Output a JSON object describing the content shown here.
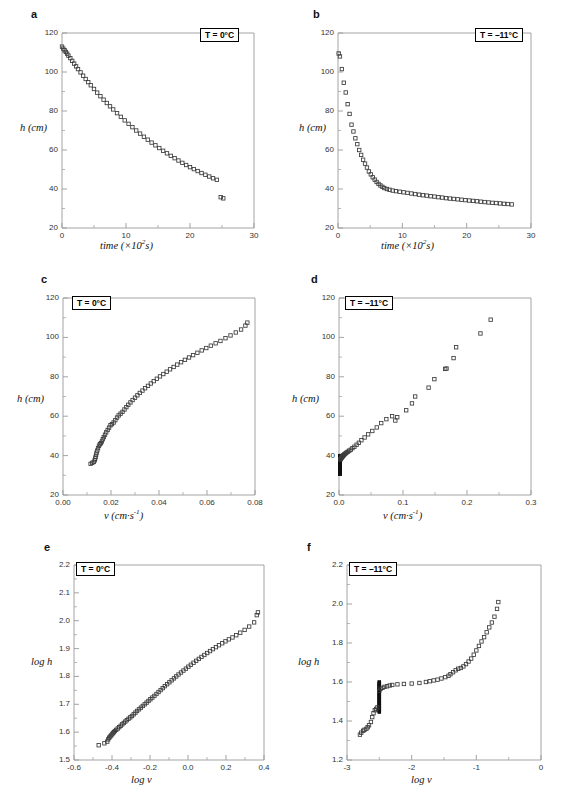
{
  "figure": {
    "width": 563,
    "height": 801,
    "background": "#ffffff",
    "marker_color": "#3a3a3a",
    "axis_color": "#9a9a9a",
    "dense_color": "#111111"
  },
  "panels": [
    {
      "letter": "a",
      "temperature_label": "T = 0°C",
      "xlabel_html": "time (×10<sup>2</sup>s)",
      "ylabel": "h (cm)",
      "xticks": [
        "0",
        "10",
        "20",
        "30"
      ],
      "yticks": [
        "20",
        "40",
        "60",
        "80",
        "100",
        "120"
      ]
    },
    {
      "letter": "b",
      "temperature_label": "T = –11°C",
      "xlabel_html": "time (×10<sup>2</sup>s)",
      "ylabel": "h (cm)",
      "xticks": [
        "0",
        "10",
        "20",
        "30"
      ],
      "yticks": [
        "20",
        "40",
        "60",
        "80",
        "100",
        "120"
      ]
    },
    {
      "letter": "c",
      "temperature_label": "T = 0°C",
      "xlabel_html": "v (cm·s<sup>-1</sup>)",
      "ylabel": "h (cm)",
      "xticks": [
        "0.00",
        "0.02",
        "0.04",
        "0.06",
        "0.08"
      ],
      "yticks": [
        "20",
        "40",
        "60",
        "80",
        "100",
        "120"
      ]
    },
    {
      "letter": "d",
      "temperature_label": "T = –11°C",
      "xlabel_html": "v (cm·s<sup>-1</sup>)",
      "ylabel": "h (cm)",
      "xticks": [
        "0.0",
        "0.1",
        "0.2",
        "0.3"
      ],
      "yticks": [
        "20",
        "40",
        "60",
        "80",
        "100",
        "120"
      ]
    },
    {
      "letter": "e",
      "temperature_label": "T = 0°C",
      "xlabel_html": "log v",
      "ylabel": "log h",
      "xticks": [
        "-0.6",
        "-0.4",
        "-0.2",
        "0.0",
        "0.2",
        "0.4"
      ],
      "yticks": [
        "1.5",
        "1.6",
        "1.7",
        "1.8",
        "1.9",
        "2.0",
        "2.1",
        "2.2"
      ]
    },
    {
      "letter": "f",
      "temperature_label": "T = –11°C",
      "xlabel_html": "log v",
      "ylabel": "log h",
      "xticks": [
        "-3",
        "-2",
        "-1",
        "0"
      ],
      "yticks": [
        "1.2",
        "1.4",
        "1.6",
        "1.8",
        "2.0",
        "2.2"
      ]
    }
  ],
  "chart_data": [
    {
      "panel": "a",
      "type": "scatter",
      "title": "",
      "xlabel": "time (×10^2 s)",
      "ylabel": "h (cm)",
      "xlim": [
        0,
        30
      ],
      "ylim": [
        20,
        120
      ],
      "xticks": [
        0,
        10,
        20,
        30
      ],
      "yticks": [
        20,
        40,
        60,
        80,
        100,
        120
      ],
      "grid": false,
      "legend": "T = 0°C",
      "marker": "open-square",
      "x": [
        0.0,
        0.2,
        0.4,
        0.6,
        0.8,
        1.0,
        1.3,
        1.6,
        1.9,
        2.2,
        2.5,
        2.9,
        3.3,
        3.7,
        4.1,
        4.5,
        5.0,
        5.5,
        6.0,
        6.5,
        7.0,
        7.5,
        8.0,
        8.6,
        9.2,
        9.8,
        10.4,
        11.0,
        11.6,
        12.2,
        12.8,
        13.4,
        14.0,
        14.6,
        15.2,
        15.8,
        16.4,
        17.0,
        17.6,
        18.2,
        18.8,
        19.4,
        20.0,
        20.6,
        21.2,
        21.8,
        22.4,
        23.0,
        23.6,
        24.2,
        24.8,
        25.2
      ],
      "y": [
        113.0,
        112.0,
        111.2,
        110.3,
        109.4,
        108.4,
        107.1,
        105.7,
        104.3,
        102.9,
        101.5,
        99.8,
        98.1,
        96.4,
        94.8,
        93.2,
        91.3,
        89.4,
        87.6,
        85.8,
        84.1,
        82.4,
        80.8,
        78.9,
        77.0,
        75.2,
        73.4,
        71.7,
        70.0,
        68.4,
        66.8,
        65.3,
        63.8,
        62.4,
        61.0,
        59.6,
        58.3,
        57.0,
        55.8,
        54.6,
        53.4,
        52.3,
        51.2,
        50.2,
        49.2,
        48.2,
        47.3,
        46.4,
        45.5,
        44.7,
        35.8,
        35.2
      ]
    },
    {
      "panel": "b",
      "type": "scatter",
      "title": "",
      "xlabel": "time (×10^2 s)",
      "ylabel": "h (cm)",
      "xlim": [
        0,
        30
      ],
      "ylim": [
        20,
        120
      ],
      "xticks": [
        0,
        10,
        20,
        30
      ],
      "yticks": [
        20,
        40,
        60,
        80,
        100,
        120
      ],
      "grid": false,
      "legend": "T = –11°C",
      "marker": "open-square",
      "x": [
        0.1,
        0.3,
        0.6,
        0.9,
        1.2,
        1.5,
        1.8,
        2.1,
        2.4,
        2.7,
        3.0,
        3.3,
        3.6,
        3.9,
        4.2,
        4.5,
        4.8,
        5.1,
        5.4,
        5.7,
        6.0,
        6.3,
        6.6,
        6.9,
        7.2,
        7.6,
        8.0,
        8.5,
        9.0,
        9.6,
        10.2,
        10.8,
        11.4,
        12.0,
        12.6,
        13.2,
        13.8,
        14.4,
        15.0,
        15.6,
        16.2,
        16.8,
        17.4,
        18.0,
        18.6,
        19.2,
        19.8,
        20.4,
        21.0,
        21.6,
        22.2,
        22.8,
        23.4,
        24.0,
        24.6,
        25.2,
        25.8,
        26.4,
        27.0
      ],
      "y": [
        109.5,
        108.0,
        101.5,
        94.5,
        89.5,
        83.5,
        78.5,
        73.0,
        69.5,
        66.0,
        63.0,
        60.0,
        57.5,
        55.0,
        53.0,
        51.0,
        49.0,
        47.5,
        46.0,
        44.8,
        43.6,
        42.6,
        41.8,
        41.1,
        40.5,
        40.0,
        39.6,
        39.2,
        38.9,
        38.6,
        38.3,
        38.0,
        37.7,
        37.4,
        37.1,
        36.8,
        36.6,
        36.3,
        36.1,
        35.8,
        35.6,
        35.3,
        35.1,
        34.9,
        34.7,
        34.5,
        34.3,
        34.1,
        33.9,
        33.7,
        33.5,
        33.3,
        33.1,
        32.9,
        32.8,
        32.6,
        32.4,
        32.3,
        32.1
      ]
    },
    {
      "panel": "c",
      "type": "scatter",
      "title": "",
      "xlabel": "v (cm·s^-1)",
      "ylabel": "h (cm)",
      "xlim": [
        0.0,
        0.08
      ],
      "ylim": [
        20,
        120
      ],
      "xticks": [
        0.0,
        0.02,
        0.04,
        0.06,
        0.08
      ],
      "yticks": [
        20,
        40,
        60,
        80,
        100,
        120
      ],
      "grid": false,
      "legend": "T = 0°C",
      "marker": "open-square",
      "x": [
        0.0115,
        0.0122,
        0.0128,
        0.0132,
        0.0134,
        0.0136,
        0.0138,
        0.014,
        0.0143,
        0.0146,
        0.015,
        0.0154,
        0.0158,
        0.0162,
        0.0166,
        0.017,
        0.0175,
        0.018,
        0.0186,
        0.0192,
        0.0198,
        0.0204,
        0.0211,
        0.0218,
        0.0225,
        0.0232,
        0.024,
        0.0248,
        0.0256,
        0.0264,
        0.0272,
        0.0281,
        0.029,
        0.03,
        0.031,
        0.032,
        0.0331,
        0.0342,
        0.0354,
        0.0366,
        0.0378,
        0.0391,
        0.0404,
        0.0418,
        0.0432,
        0.0446,
        0.0461,
        0.0476,
        0.0492,
        0.0508,
        0.0525,
        0.0542,
        0.056,
        0.0578,
        0.0597,
        0.0616,
        0.0636,
        0.0656,
        0.0677,
        0.0698,
        0.072,
        0.0742,
        0.076,
        0.0768
      ],
      "y": [
        35.8,
        36.3,
        36.8,
        37.6,
        38.5,
        39.4,
        40.5,
        41.5,
        42.6,
        43.8,
        45.0,
        45.8,
        46.3,
        47.2,
        48.3,
        49.4,
        50.6,
        51.8,
        53.0,
        54.2,
        55.4,
        56.0,
        56.8,
        58.0,
        59.3,
        60.4,
        61.3,
        62.2,
        63.4,
        64.6,
        65.8,
        67.0,
        68.2,
        69.4,
        70.6,
        71.8,
        73.0,
        74.2,
        75.4,
        76.6,
        77.8,
        79.0,
        80.2,
        81.4,
        82.6,
        83.8,
        85.0,
        86.2,
        87.4,
        88.6,
        89.8,
        91.0,
        92.2,
        93.4,
        94.6,
        95.8,
        97.0,
        98.2,
        99.6,
        101.0,
        102.5,
        104.0,
        106.0,
        107.5
      ]
    },
    {
      "panel": "d",
      "type": "scatter",
      "title": "",
      "xlabel": "v (cm·s^-1)",
      "ylabel": "h (cm)",
      "xlim": [
        0.0,
        0.3
      ],
      "ylim": [
        20,
        120
      ],
      "xticks": [
        0.0,
        0.1,
        0.2,
        0.3
      ],
      "yticks": [
        20,
        40,
        60,
        80,
        100,
        120
      ],
      "grid": false,
      "legend": "T = –11°C",
      "marker": "open-square",
      "note": "dense vertical cluster of low-velocity points near v=0 spanning h=30-40",
      "x": [
        0.002,
        0.0025,
        0.003,
        0.0035,
        0.004,
        0.0045,
        0.005,
        0.0055,
        0.006,
        0.0065,
        0.007,
        0.008,
        0.009,
        0.0105,
        0.012,
        0.014,
        0.016,
        0.0185,
        0.021,
        0.024,
        0.0275,
        0.031,
        0.035,
        0.04,
        0.0455,
        0.052,
        0.059,
        0.066,
        0.074,
        0.083,
        0.088,
        0.091,
        0.105,
        0.114,
        0.119,
        0.14,
        0.149,
        0.166,
        0.168,
        0.179,
        0.183,
        0.221,
        0.237
      ],
      "y": [
        38.0,
        38.3,
        38.6,
        38.8,
        39.0,
        39.2,
        39.4,
        39.6,
        39.8,
        40.0,
        40.2,
        40.5,
        40.8,
        41.2,
        41.6,
        42.0,
        42.5,
        43.0,
        43.8,
        44.5,
        45.5,
        46.5,
        47.8,
        49.2,
        50.8,
        52.5,
        54.3,
        56.5,
        58.5,
        60.0,
        57.8,
        59.5,
        63.0,
        66.5,
        70.0,
        74.5,
        78.8,
        84.0,
        84.2,
        89.5,
        95.0,
        102.0,
        109.0
      ],
      "dense_cluster": {
        "x": 0.0015,
        "y_min": 30.5,
        "y_max": 40.0,
        "count": 60
      }
    },
    {
      "panel": "e",
      "type": "scatter",
      "title": "",
      "xlabel": "log v",
      "ylabel": "log h",
      "xlim": [
        -0.6,
        0.4
      ],
      "ylim": [
        1.5,
        2.2
      ],
      "xticks": [
        -0.6,
        -0.4,
        -0.2,
        0.0,
        0.2,
        0.4
      ],
      "yticks": [
        1.5,
        1.6,
        1.7,
        1.8,
        1.9,
        2.0,
        2.1,
        2.2
      ],
      "grid": false,
      "legend": "T = 0°C",
      "marker": "open-square",
      "slope_estimate": 0.57,
      "x": [
        -0.47,
        -0.44,
        -0.425,
        -0.42,
        -0.415,
        -0.41,
        -0.405,
        -0.4,
        -0.395,
        -0.39,
        -0.385,
        -0.378,
        -0.37,
        -0.362,
        -0.354,
        -0.346,
        -0.338,
        -0.33,
        -0.322,
        -0.313,
        -0.304,
        -0.295,
        -0.286,
        -0.277,
        -0.268,
        -0.258,
        -0.248,
        -0.238,
        -0.228,
        -0.218,
        -0.208,
        -0.198,
        -0.188,
        -0.177,
        -0.166,
        -0.155,
        -0.144,
        -0.133,
        -0.122,
        -0.11,
        -0.098,
        -0.086,
        -0.074,
        -0.062,
        -0.05,
        -0.037,
        -0.024,
        -0.011,
        0.002,
        0.015,
        0.029,
        0.043,
        0.057,
        0.071,
        0.086,
        0.101,
        0.116,
        0.131,
        0.147,
        0.163,
        0.18,
        0.197,
        0.215,
        0.234,
        0.254,
        0.275,
        0.298,
        0.322,
        0.348,
        0.362,
        0.368
      ],
      "y": [
        1.553,
        1.56,
        1.566,
        1.574,
        1.58,
        1.584,
        1.588,
        1.592,
        1.596,
        1.6,
        1.604,
        1.608,
        1.613,
        1.618,
        1.623,
        1.628,
        1.633,
        1.638,
        1.643,
        1.648,
        1.653,
        1.658,
        1.664,
        1.67,
        1.676,
        1.682,
        1.688,
        1.694,
        1.7,
        1.706,
        1.712,
        1.718,
        1.724,
        1.73,
        1.737,
        1.744,
        1.751,
        1.758,
        1.765,
        1.772,
        1.779,
        1.786,
        1.793,
        1.8,
        1.807,
        1.814,
        1.821,
        1.828,
        1.835,
        1.842,
        1.849,
        1.856,
        1.863,
        1.87,
        1.877,
        1.884,
        1.891,
        1.898,
        1.905,
        1.912,
        1.919,
        1.926,
        1.933,
        1.94,
        1.948,
        1.957,
        1.967,
        1.979,
        1.994,
        2.02,
        2.03
      ]
    },
    {
      "panel": "f",
      "type": "scatter",
      "title": "",
      "xlabel": "log v",
      "ylabel": "log h",
      "xlim": [
        -3,
        0
      ],
      "ylim": [
        1.2,
        2.2
      ],
      "xticks": [
        -3,
        -2,
        -1,
        0
      ],
      "yticks": [
        1.2,
        1.4,
        1.6,
        1.8,
        2.0,
        2.2
      ],
      "grid": false,
      "legend": "T = –11°C",
      "marker": "open-square",
      "note": "sigmoidal curve with plateau near log h = 1.59 between log v = -2.4 and -1.5; dense vertical bar at log v = -2.50",
      "x": [
        -2.8,
        -2.78,
        -2.75,
        -2.73,
        -2.7,
        -2.68,
        -2.66,
        -2.63,
        -2.61,
        -2.59,
        -2.57,
        -2.55,
        -2.53,
        -2.5,
        -2.48,
        -2.45,
        -2.42,
        -2.38,
        -2.34,
        -2.3,
        -2.22,
        -2.12,
        -2.0,
        -1.88,
        -1.78,
        -1.72,
        -1.66,
        -1.6,
        -1.54,
        -1.48,
        -1.43,
        -1.4,
        -1.36,
        -1.32,
        -1.28,
        -1.24,
        -1.2,
        -1.16,
        -1.12,
        -1.08,
        -1.04,
        -1.0,
        -0.96,
        -0.92,
        -0.88,
        -0.84,
        -0.8,
        -0.76,
        -0.72,
        -0.68,
        -0.66
      ],
      "y": [
        1.33,
        1.34,
        1.35,
        1.355,
        1.36,
        1.368,
        1.378,
        1.395,
        1.42,
        1.44,
        1.455,
        1.462,
        1.47,
        1.555,
        1.565,
        1.57,
        1.575,
        1.578,
        1.582,
        1.585,
        1.588,
        1.59,
        1.592,
        1.595,
        1.6,
        1.604,
        1.608,
        1.612,
        1.618,
        1.625,
        1.632,
        1.64,
        1.65,
        1.66,
        1.668,
        1.672,
        1.68,
        1.692,
        1.705,
        1.72,
        1.74,
        1.762,
        1.785,
        1.808,
        1.83,
        1.855,
        1.88,
        1.905,
        1.935,
        1.975,
        2.01
      ],
      "dense_cluster": {
        "x": -2.5,
        "y_min": 1.445,
        "y_max": 1.6,
        "count": 40
      }
    }
  ]
}
